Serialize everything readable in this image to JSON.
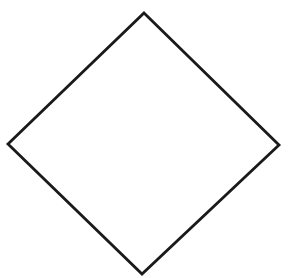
{
  "diagram": {
    "shape": "diamond",
    "background": "#ffffff",
    "fill": "#ffffff",
    "stroke": "#1a1a1a",
    "stroke_width": 2.8,
    "vertices": {
      "top": [
        144,
        13
      ],
      "right": [
        279,
        145
      ],
      "bottom": [
        142,
        274
      ],
      "left": [
        8,
        144
      ]
    },
    "points": "144,13 279,145 142,274 8,144"
  }
}
